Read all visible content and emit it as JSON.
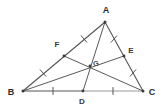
{
  "figure": {
    "width": 163,
    "height": 108,
    "background_color": "#ffffff"
  },
  "style": {
    "side_color": "#555555",
    "median_color": "#5a5a5a",
    "base_right_color": "#9a9a9a",
    "tick_color": "#555555",
    "point_color": "#3a3a3a",
    "label_color": "#2b2b2b",
    "side_width": 1.1,
    "median_width": 1.0
  },
  "points": {
    "A": {
      "label": "A",
      "x": 105,
      "y": 22,
      "label_x": 106,
      "label_y": 13,
      "kind": "vertex"
    },
    "B": {
      "label": "B",
      "x": 23,
      "y": 91,
      "label_x": 11,
      "label_y": 95,
      "kind": "vertex"
    },
    "C": {
      "label": "C",
      "x": 143,
      "y": 91,
      "label_x": 150,
      "label_y": 95,
      "kind": "vertex"
    },
    "D": {
      "label": "D",
      "x": 83,
      "y": 91,
      "label_x": 80,
      "label_y": 103,
      "kind": "midpoint-bc"
    },
    "E": {
      "label": "E",
      "x": 124,
      "y": 56,
      "label_x": 129,
      "label_y": 52,
      "kind": "midpoint-ac"
    },
    "F": {
      "label": "F",
      "x": 64,
      "y": 56,
      "label_x": 56,
      "label_y": 46,
      "kind": "midpoint-ab"
    },
    "G": {
      "label": "G",
      "x": 90,
      "y": 66,
      "label_x": 94,
      "label_y": 65,
      "kind": "centroid"
    }
  },
  "segments": [
    {
      "name": "side-AB",
      "from": "A",
      "to": "B",
      "role": "triangle-side",
      "color": "#555555"
    },
    {
      "name": "side-AC",
      "from": "A",
      "to": "C",
      "role": "triangle-side",
      "color": "#555555"
    },
    {
      "name": "base-BD",
      "from": "B",
      "to": "D",
      "role": "triangle-side",
      "color": "#555555"
    },
    {
      "name": "base-DC",
      "from": "D",
      "to": "C",
      "role": "triangle-side",
      "color": "#9a9a9a"
    },
    {
      "name": "median-AD",
      "from": "A",
      "to": "D",
      "role": "median",
      "color": "#5a5a5a"
    },
    {
      "name": "median-BE",
      "from": "B",
      "to": "E",
      "role": "median",
      "color": "#5a5a5a"
    },
    {
      "name": "median-CF",
      "from": "C",
      "to": "F",
      "role": "median",
      "color": "#5a5a5a"
    }
  ],
  "tick_marks": [
    {
      "name": "tick-BD",
      "on": "base-BD",
      "x": 53,
      "y": 91,
      "angle": 90
    },
    {
      "name": "tick-DC",
      "on": "base-DC",
      "x": 113,
      "y": 91,
      "angle": 90
    },
    {
      "name": "tick-AF",
      "on": "segment-AF",
      "x": 84,
      "y": 39,
      "angle": 40
    },
    {
      "name": "tick-FB",
      "on": "segment-FB",
      "x": 43,
      "y": 73,
      "angle": 40
    },
    {
      "name": "tick-AE",
      "on": "segment-AE",
      "x": 114,
      "y": 39,
      "angle": -58
    },
    {
      "name": "tick-EC",
      "on": "segment-EC",
      "x": 133,
      "y": 73,
      "angle": -58
    }
  ],
  "annotations": {
    "description": "Triangle ABC with midpoints D on BC, E on AC, F on AB. The three medians AD, BE and CF are concurrent at the centroid G. Matching tick marks show BD = DC, AF = FB and AE = EC."
  }
}
